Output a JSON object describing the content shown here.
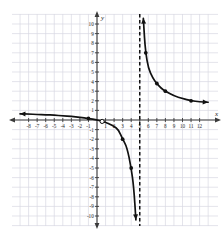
{
  "chart_data": {
    "type": "line",
    "title": "",
    "xlabel": "x",
    "ylabel": "y",
    "xlim": [
      -9,
      13
    ],
    "ylim": [
      -11,
      11
    ],
    "grid": true,
    "legend": "none",
    "xticks": [
      -8,
      -7,
      -6,
      -5,
      -4,
      -3,
      -2,
      -1,
      1,
      2,
      3,
      4,
      5,
      6,
      7,
      8,
      9,
      10,
      11,
      12
    ],
    "xtick_labels": [
      "-8",
      "-7",
      "-6",
      "-5",
      "-4",
      "-3",
      "-2",
      "-1",
      "1",
      "2",
      "3",
      "4",
      "5",
      "6",
      "7",
      "8",
      "9",
      "10",
      "11",
      "12"
    ],
    "yticks": [
      -10,
      -9,
      -8,
      -7,
      -6,
      -5,
      -4,
      -3,
      -2,
      -1,
      1,
      2,
      3,
      4,
      5,
      6,
      7,
      8,
      9,
      10
    ],
    "ytick_labels": [
      "-10",
      "-9",
      "-8",
      "-7",
      "-6",
      "-5",
      "-4",
      "-3",
      "-2",
      "-1",
      "1",
      "2",
      "3",
      "4",
      "5",
      "6",
      "7",
      "8",
      "9",
      "10"
    ],
    "asymptotes": [
      {
        "type": "vertical",
        "value": 5,
        "style": "dashed",
        "color": "#111111"
      },
      {
        "type": "horizontal",
        "value": 1,
        "style": "implied",
        "color": "#111111"
      }
    ],
    "series": [
      {
        "name": "left-branch",
        "style": "solid",
        "color": "#111111",
        "arrow_start": true,
        "arrow_end": true,
        "points": [
          {
            "x": -9.0,
            "y": 0.64
          },
          {
            "x": -8.0,
            "y": 0.62
          },
          {
            "x": -7.0,
            "y": 0.58
          },
          {
            "x": -6.0,
            "y": 0.55
          },
          {
            "x": -5.0,
            "y": 0.5
          },
          {
            "x": -4.0,
            "y": 0.44
          },
          {
            "x": -3.0,
            "y": 0.38
          },
          {
            "x": -2.0,
            "y": 0.29
          },
          {
            "x": -1.0,
            "y": 0.17
          },
          {
            "x": 0.0,
            "y": 0.0
          },
          {
            "x": 0.5,
            "y": -0.11
          },
          {
            "x": 1.0,
            "y": -0.25
          },
          {
            "x": 1.5,
            "y": -0.43
          },
          {
            "x": 2.0,
            "y": -0.67
          },
          {
            "x": 2.5,
            "y": -1.0
          },
          {
            "x": 3.0,
            "y": -2.0
          },
          {
            "x": 3.5,
            "y": -2.8
          },
          {
            "x": 4.0,
            "y": -5.0
          },
          {
            "x": 4.3,
            "y": -7.0
          },
          {
            "x": 4.55,
            "y": -10.4
          }
        ]
      },
      {
        "name": "right-branch",
        "style": "solid",
        "color": "#111111",
        "arrow_start": true,
        "arrow_end": true,
        "points": [
          {
            "x": 5.42,
            "y": 10.6
          },
          {
            "x": 5.55,
            "y": 8.6
          },
          {
            "x": 5.7,
            "y": 7.0
          },
          {
            "x": 6.0,
            "y": 5.4
          },
          {
            "x": 6.5,
            "y": 4.4
          },
          {
            "x": 7.0,
            "y": 3.8
          },
          {
            "x": 7.5,
            "y": 3.3
          },
          {
            "x": 8.0,
            "y": 3.0
          },
          {
            "x": 9.0,
            "y": 2.5
          },
          {
            "x": 10.0,
            "y": 2.25
          },
          {
            "x": 11.0,
            "y": 2.0
          },
          {
            "x": 12.0,
            "y": 1.9
          },
          {
            "x": 13.0,
            "y": 1.85
          }
        ]
      }
    ],
    "marked_points": [
      {
        "x": -1.0,
        "y": 0.17,
        "fill": "closed"
      },
      {
        "x": 3.0,
        "y": -2.0,
        "fill": "closed"
      },
      {
        "x": 4.0,
        "y": -5.0,
        "fill": "closed"
      },
      {
        "x": 5.7,
        "y": 7.0,
        "fill": "closed"
      },
      {
        "x": 7.0,
        "y": 3.8,
        "fill": "closed"
      },
      {
        "x": 8.0,
        "y": 3.0,
        "fill": "closed"
      },
      {
        "x": 11.0,
        "y": 2.0,
        "fill": "closed"
      }
    ],
    "hole_points": [
      {
        "x": 0.6,
        "y": -0.15,
        "fill": "open"
      }
    ],
    "colors": {
      "curve": "#111111",
      "axis": "#3a3a3a",
      "grid": "#d8d8e2",
      "asymptote": "#111111",
      "background": "#ffffff"
    }
  }
}
